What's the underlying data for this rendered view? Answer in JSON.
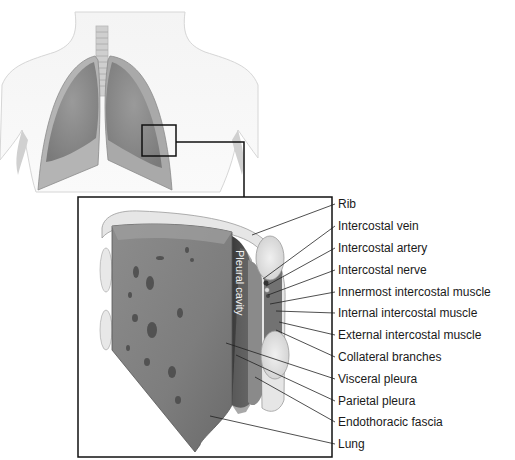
{
  "diagram": {
    "inset_label": "Pleural cavity",
    "labels": [
      {
        "text": "Rib",
        "y": 204,
        "tx": 252,
        "ty": 235
      },
      {
        "text": "Intercostal vein",
        "y": 226,
        "tx": 263,
        "ty": 279
      },
      {
        "text": "Intercostal artery",
        "y": 248,
        "tx": 266,
        "ty": 286
      },
      {
        "text": "Intercostal nerve",
        "y": 270,
        "tx": 268,
        "ty": 295
      },
      {
        "text": "Innermost intercostal muscle",
        "y": 292,
        "tx": 270,
        "ty": 304
      },
      {
        "text": "Internal intercostal muscle",
        "y": 313,
        "tx": 276,
        "ty": 311
      },
      {
        "text": "External intercostal muscle",
        "y": 335,
        "tx": 279,
        "ty": 322
      },
      {
        "text": "Collateral branches",
        "y": 357,
        "tx": 276,
        "ty": 330
      },
      {
        "text": "Visceral pleura",
        "y": 379,
        "tx": 226,
        "ty": 343
      },
      {
        "text": "Parietal pleura",
        "y": 401,
        "tx": 236,
        "ty": 355
      },
      {
        "text": "Endothoracic fascia",
        "y": 422,
        "tx": 255,
        "ty": 377
      },
      {
        "text": "Lung",
        "y": 444,
        "tx": 210,
        "ty": 416
      }
    ]
  }
}
